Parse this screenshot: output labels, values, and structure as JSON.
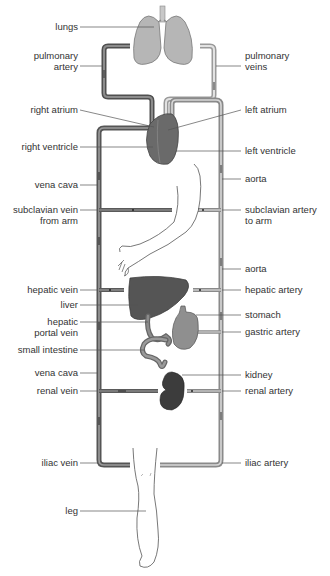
{
  "colors": {
    "vein": "#6e6e6e",
    "vein_dark": "#4a4a4a",
    "artery": "#c8c8c8",
    "artery_dark": "#8e8e8e",
    "lungs": "#b4b4b4",
    "heart": "#6a6a6a",
    "liver": "#555555",
    "stomach": "#8f8f8f",
    "kidney": "#3c3c3c",
    "label_text": "#333333",
    "leader_line": "#555555"
  },
  "labels_left": [
    {
      "id": "lungs",
      "text": "lungs",
      "lines": [
        "lungs"
      ]
    },
    {
      "id": "pulmonary-artery",
      "text": "pulmonary artery",
      "lines": [
        "pulmonary",
        "artery"
      ]
    },
    {
      "id": "right-atrium",
      "text": "right atrium",
      "lines": [
        "right atrium"
      ]
    },
    {
      "id": "right-ventricle",
      "text": "right ventricle",
      "lines": [
        "right ventricle"
      ]
    },
    {
      "id": "vena-cava-upper",
      "text": "vena cava",
      "lines": [
        "vena cava"
      ]
    },
    {
      "id": "subclavian-vein",
      "text": "subclavian vein from arm",
      "lines": [
        "subclavian vein",
        "from arm"
      ]
    },
    {
      "id": "hepatic-vein",
      "text": "hepatic vein",
      "lines": [
        "hepatic vein"
      ]
    },
    {
      "id": "liver",
      "text": "liver",
      "lines": [
        "liver"
      ]
    },
    {
      "id": "hepatic-portal-vein",
      "text": "hepatic portal vein",
      "lines": [
        "hepatic",
        "portal vein"
      ]
    },
    {
      "id": "small-intestine",
      "text": "small intestine",
      "lines": [
        "small intestine"
      ]
    },
    {
      "id": "vena-cava-lower",
      "text": "vena cava",
      "lines": [
        "vena cava"
      ]
    },
    {
      "id": "renal-vein",
      "text": "renal vein",
      "lines": [
        "renal vein"
      ]
    },
    {
      "id": "iliac-vein",
      "text": "iliac vein",
      "lines": [
        "iliac vein"
      ]
    },
    {
      "id": "leg",
      "text": "leg",
      "lines": [
        "leg"
      ]
    }
  ],
  "labels_right": [
    {
      "id": "pulmonary-veins",
      "text": "pulmonary veins",
      "lines": [
        "pulmonary",
        "veins"
      ]
    },
    {
      "id": "left-atrium",
      "text": "left atrium",
      "lines": [
        "left atrium"
      ]
    },
    {
      "id": "left-ventricle",
      "text": "left ventricle",
      "lines": [
        "left ventricle"
      ]
    },
    {
      "id": "aorta-upper",
      "text": "aorta",
      "lines": [
        "aorta"
      ]
    },
    {
      "id": "subclavian-artery",
      "text": "subclavian artery to arm",
      "lines": [
        "subclavian artery",
        "to arm"
      ]
    },
    {
      "id": "aorta-lower",
      "text": "aorta",
      "lines": [
        "aorta"
      ]
    },
    {
      "id": "hepatic-artery",
      "text": "hepatic artery",
      "lines": [
        "hepatic artery"
      ]
    },
    {
      "id": "stomach",
      "text": "stomach",
      "lines": [
        "stomach"
      ]
    },
    {
      "id": "gastric-artery",
      "text": "gastric artery",
      "lines": [
        "gastric artery"
      ]
    },
    {
      "id": "kidney",
      "text": "kidney",
      "lines": [
        "kidney"
      ]
    },
    {
      "id": "renal-artery",
      "text": "renal artery",
      "lines": [
        "renal artery"
      ]
    },
    {
      "id": "iliac-artery",
      "text": "iliac artery",
      "lines": [
        "iliac artery"
      ]
    }
  ]
}
